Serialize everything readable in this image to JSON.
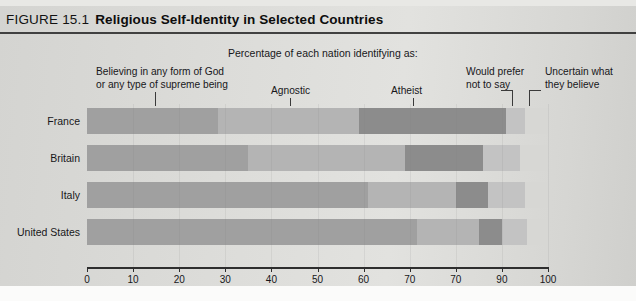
{
  "figure": {
    "number": "FIGURE 15.1",
    "title": "Religious Self-Identity in Selected Countries"
  },
  "subtitle": "Percentage of each nation identifying as:",
  "captions": {
    "belief_line1": "Believing in any form of God",
    "belief_line2": "or any type of supreme being",
    "agnostic": "Agnostic",
    "atheist": "Atheist",
    "prefer_line1": "Would prefer",
    "prefer_line2": "not to say",
    "uncertain_line1": "Uncertain what",
    "uncertain_line2": "they believe"
  },
  "colors": {
    "belief": "#a0a0a0",
    "agnostic": "#b4b4b4",
    "atheist": "#8c8c8c",
    "prefer": "#c3c3c3",
    "uncertain": "#d7d7d4",
    "background": "#d9d9d6",
    "axis": "#2e2e2e"
  },
  "chart_data": {
    "type": "bar",
    "orientation": "horizontal",
    "stacked": true,
    "title": "Religious Self-Identity in Selected Countries",
    "subtitle": "Percentage of each nation identifying as:",
    "xlabel": "",
    "ylabel": "",
    "xlim": [
      0,
      100
    ],
    "xticks": [
      0,
      10,
      20,
      30,
      40,
      50,
      60,
      70,
      80,
      90,
      100
    ],
    "xticklabels": [
      "0",
      "10",
      "20",
      "30",
      "40",
      "50",
      "60",
      "70",
      "70",
      "90",
      "100"
    ],
    "grid": false,
    "legend": "annotated-callouts",
    "categories": [
      "France",
      "Britain",
      "Italy",
      "United States"
    ],
    "series": [
      {
        "name": "Believing in any form of God or any type of supreme being",
        "values": [
          28.5,
          35.0,
          61.0,
          71.5
        ]
      },
      {
        "name": "Agnostic",
        "values": [
          30.5,
          34.0,
          19.0,
          13.5
        ]
      },
      {
        "name": "Atheist",
        "values": [
          32.0,
          17.0,
          7.0,
          5.0
        ]
      },
      {
        "name": "Would prefer not to say",
        "values": [
          4.0,
          8.0,
          8.0,
          5.5
        ]
      },
      {
        "name": "Uncertain what they believe",
        "values": [
          5.0,
          6.0,
          5.0,
          4.5
        ]
      }
    ]
  },
  "axis": {
    "ticklabels": [
      "0",
      "10",
      "20",
      "30",
      "40",
      "50",
      "60",
      "70",
      "70",
      "90",
      "100"
    ]
  },
  "rows": [
    {
      "country": "France",
      "segments": [
        28.5,
        30.5,
        32.0,
        4.0,
        5.0
      ]
    },
    {
      "country": "Britain",
      "segments": [
        35.0,
        34.0,
        17.0,
        8.0,
        6.0
      ]
    },
    {
      "country": "Italy",
      "segments": [
        61.0,
        19.0,
        7.0,
        8.0,
        5.0
      ]
    },
    {
      "country": "United States",
      "segments": [
        71.5,
        13.5,
        5.0,
        5.5,
        4.5
      ]
    }
  ]
}
